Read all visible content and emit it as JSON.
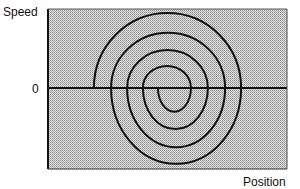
{
  "chart_data": {
    "type": "line",
    "title": "",
    "xlabel": "Position",
    "ylabel": "Speed",
    "ytick_labels": [
      "0"
    ],
    "xlim": [
      0,
      100
    ],
    "ylim": [
      -1,
      1
    ],
    "grid": false,
    "legend": "none",
    "background_fill": "#c9c9c9",
    "line_color": "#111111",
    "series": [
      {
        "name": "phase-spiral",
        "description": "Inward spiral trajectory composed of alternating upper and lower half-arcs",
        "arcs": [
          {
            "half": "upper",
            "from_x": 19.2,
            "to_x": 80.8,
            "peak": 0.95
          },
          {
            "half": "lower",
            "from_x": 80.8,
            "to_x": 26.4,
            "peak": -0.96
          },
          {
            "half": "upper",
            "from_x": 26.4,
            "to_x": 74.1,
            "peak": 0.7
          },
          {
            "half": "lower",
            "from_x": 74.1,
            "to_x": 33.1,
            "peak": -0.75
          },
          {
            "half": "upper",
            "from_x": 33.1,
            "to_x": 66.9,
            "peak": 0.48
          },
          {
            "half": "lower",
            "from_x": 66.9,
            "to_x": 39.7,
            "peak": -0.52
          },
          {
            "half": "upper",
            "from_x": 39.7,
            "to_x": 59.8,
            "peak": 0.28
          },
          {
            "half": "lower",
            "from_x": 59.8,
            "to_x": 46.0,
            "peak": -0.3
          }
        ]
      }
    ]
  }
}
